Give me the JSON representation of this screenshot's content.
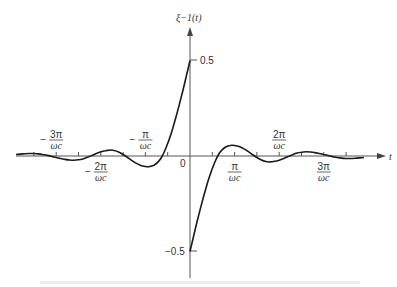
{
  "chart_data": {
    "type": "line",
    "title": "",
    "ylabel": "ξ−1(t)",
    "xlabel": "t",
    "ylim": [
      -0.55,
      0.62
    ],
    "yticks": [
      {
        "value": 0.5,
        "label": "0.5"
      },
      {
        "value": -0.5,
        "label": "−0.5"
      }
    ],
    "origin_label": "0",
    "xtick_labels": [
      {
        "num": "−3π",
        "den": "ωc",
        "pos": -3,
        "side": "above"
      },
      {
        "num": "−2π",
        "den": "ωc",
        "pos": -2,
        "side": "below"
      },
      {
        "num": "−π",
        "den": "ωc",
        "pos": -1,
        "side": "above"
      },
      {
        "num": "π",
        "den": "ωc",
        "pos": 1,
        "side": "below"
      },
      {
        "num": "2π",
        "den": "ωc",
        "pos": 2,
        "side": "above"
      },
      {
        "num": "3π",
        "den": "ωc",
        "pos": 3,
        "side": "below"
      }
    ],
    "minor_tick_spacing": "π/(2ωc)",
    "x_units": "π/ωc",
    "series": [
      {
        "name": "ξ−1(t) for t>0",
        "x": [
          0.0,
          0.08,
          0.16,
          0.24,
          0.32,
          0.4,
          0.48,
          0.56,
          0.64,
          0.72,
          0.8,
          0.9,
          1.0,
          1.1,
          1.2,
          1.3,
          1.4,
          1.5,
          1.6,
          1.7,
          1.8,
          1.9,
          2.0,
          2.1,
          2.2,
          2.3,
          2.4,
          2.5,
          2.6,
          2.7,
          2.8,
          2.9,
          3.0,
          3.1,
          3.2,
          3.3,
          3.4,
          3.5,
          3.6,
          3.7,
          3.8,
          3.9
        ],
        "y": [
          -0.5,
          -0.42,
          -0.343,
          -0.269,
          -0.199,
          -0.135,
          -0.078,
          -0.03,
          0.008,
          0.032,
          0.047,
          0.055,
          0.055,
          0.05,
          0.039,
          0.024,
          0.008,
          -0.008,
          -0.021,
          -0.029,
          -0.031,
          -0.028,
          -0.022,
          -0.013,
          -0.003,
          0.007,
          0.015,
          0.02,
          0.022,
          0.021,
          0.018,
          0.013,
          0.008,
          0.002,
          -0.003,
          -0.008,
          -0.011,
          -0.013,
          -0.013,
          -0.012,
          -0.01,
          -0.008
        ]
      },
      {
        "name": "ξ−1(t) for t<0 (odd symmetry)",
        "x": [
          0.0,
          -0.08,
          -0.16,
          -0.24,
          -0.32,
          -0.4,
          -0.48,
          -0.56,
          -0.64,
          -0.72,
          -0.8,
          -0.9,
          -1.0,
          -1.1,
          -1.2,
          -1.3,
          -1.4,
          -1.5,
          -1.6,
          -1.7,
          -1.8,
          -1.9,
          -2.0,
          -2.1,
          -2.2,
          -2.3,
          -2.4,
          -2.5,
          -2.6,
          -2.7,
          -2.8,
          -2.9,
          -3.0,
          -3.1,
          -3.2,
          -3.3,
          -3.4,
          -3.5,
          -3.6,
          -3.7,
          -3.8,
          -3.9
        ],
        "y": [
          0.5,
          0.42,
          0.343,
          0.269,
          0.199,
          0.135,
          0.078,
          0.03,
          -0.008,
          -0.032,
          -0.047,
          -0.055,
          -0.055,
          -0.05,
          -0.039,
          -0.024,
          -0.008,
          0.008,
          0.021,
          0.029,
          0.031,
          0.028,
          0.022,
          0.013,
          0.003,
          -0.007,
          -0.015,
          -0.02,
          -0.022,
          -0.021,
          -0.018,
          -0.013,
          -0.008,
          -0.002,
          0.003,
          0.008,
          0.011,
          0.013,
          0.013,
          0.012,
          0.01,
          0.008
        ]
      }
    ],
    "grid": false,
    "legend": null
  },
  "colors": {
    "axis": "#555555",
    "curve": "#1a1a1a",
    "text": "#333333"
  }
}
